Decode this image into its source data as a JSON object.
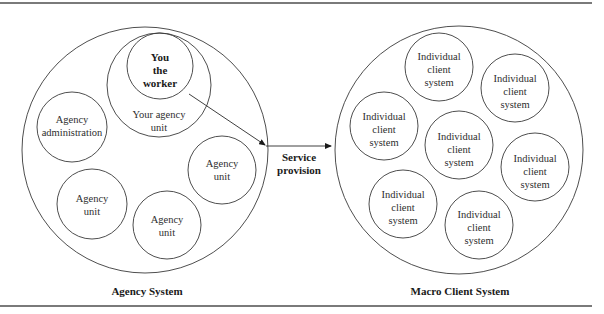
{
  "diagram": {
    "agency_system": {
      "title": "Agency System",
      "worker": {
        "line1": "You",
        "line2": "the",
        "line3": "worker"
      },
      "your_unit": {
        "line1": "Your agency",
        "line2": "unit"
      },
      "administration": {
        "line1": "Agency",
        "line2": "administration"
      },
      "units": [
        {
          "line1": "Agency",
          "line2": "unit"
        },
        {
          "line1": "Agency",
          "line2": "unit"
        },
        {
          "line1": "Agency",
          "line2": "unit"
        }
      ]
    },
    "connector": {
      "line1": "Service",
      "line2": "provision"
    },
    "client_system": {
      "title": "Macro Client System",
      "clients": [
        {
          "line1": "Individual",
          "line2": "client",
          "line3": "system"
        },
        {
          "line1": "Individual",
          "line2": "client",
          "line3": "system"
        },
        {
          "line1": "Individual",
          "line2": "client",
          "line3": "system"
        },
        {
          "line1": "Individual",
          "line2": "client",
          "line3": "system"
        },
        {
          "line1": "Individual",
          "line2": "client",
          "line3": "system"
        },
        {
          "line1": "Individual",
          "line2": "client",
          "line3": "system"
        },
        {
          "line1": "Individual",
          "line2": "client",
          "line3": "system"
        }
      ]
    }
  }
}
